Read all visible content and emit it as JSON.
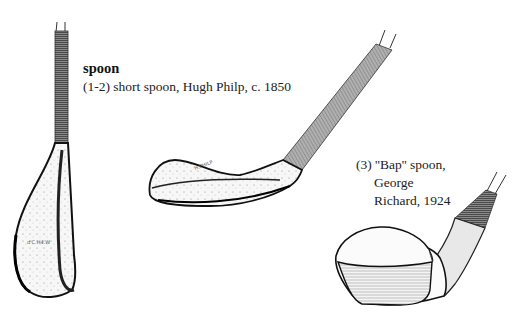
{
  "heading": "spoon",
  "captions": {
    "clubs_1_2": "(1-2) short spoon, Hugh Philp, c. 1850",
    "club_3": {
      "line1": "(3) ““Bap’’ spoon,",
      "line1_plain": "(3) ''Bap'' spoon,",
      "line2": "George",
      "line3": "Richard, 1924"
    }
  },
  "illustrations": [
    {
      "id": 1,
      "description": "short spoon, face-on view, vertical"
    },
    {
      "id": 2,
      "description": "short spoon, side view, long head"
    },
    {
      "id": 3,
      "description": "Bap spoon, three-quarter view"
    }
  ],
  "colors": {
    "ink": "#1a1a1a",
    "paper": "#ffffff",
    "grip": "#6a6a6a"
  }
}
